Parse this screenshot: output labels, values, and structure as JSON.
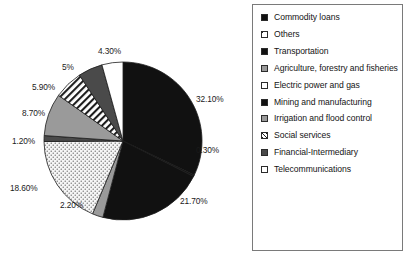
{
  "chart_data": {
    "type": "pie",
    "title": "",
    "legend_position": "right",
    "categories": [
      "Commodity loans",
      "Others",
      "Transportation",
      "Agriculture, forestry and fisheries",
      "Electric power and gas",
      "Mining and manufacturing",
      "Irrigation and flood control",
      "Social services",
      "Financial-Intermediary",
      "Telecommunications"
    ],
    "values": [
      32.1,
      0.3,
      21.7,
      2.2,
      18.6,
      1.2,
      8.7,
      5.9,
      5.0,
      4.3
    ],
    "value_labels": [
      "32.10%",
      "0.30%",
      "21.70%",
      "2.20%",
      "18.60%",
      "1.20%",
      "8.70%",
      "5.90%",
      "5%",
      "4.30%"
    ],
    "units": "percent",
    "slice_fills": [
      "black",
      "black",
      "black",
      "gray",
      "dots",
      "darkgray",
      "gray",
      "hatch",
      "darkgray",
      "white"
    ]
  },
  "pie": {
    "labels": [
      {
        "text": "32.10%",
        "left": 196,
        "top": 94
      },
      {
        "text": "0.30%",
        "left": 196,
        "top": 145
      },
      {
        "text": "21.70%",
        "left": 180,
        "top": 196
      },
      {
        "text": "2.20%",
        "left": 60,
        "top": 200
      },
      {
        "text": "18.60%",
        "left": 10,
        "top": 183
      },
      {
        "text": "1.20%",
        "left": 12,
        "top": 136
      },
      {
        "text": "8.70%",
        "left": 22,
        "top": 108
      },
      {
        "text": "5.90%",
        "left": 32,
        "top": 82
      },
      {
        "text": "5%",
        "left": 62,
        "top": 62
      },
      {
        "text": "4.30%",
        "left": 98,
        "top": 46
      }
    ]
  },
  "legend": {
    "items": [
      {
        "label": "Commodity loans",
        "fill": "sw-black"
      },
      {
        "label": "Others",
        "fill": "sw-crosshatch"
      },
      {
        "label": "Transportation",
        "fill": "sw-black"
      },
      {
        "label": "Agriculture, forestry and fisheries",
        "fill": "sw-gray"
      },
      {
        "label": "Electric power and gas",
        "fill": "sw-white"
      },
      {
        "label": "Mining and manufacturing",
        "fill": "sw-black"
      },
      {
        "label": "Irrigation and flood control",
        "fill": "sw-gray"
      },
      {
        "label": "Social services",
        "fill": "sw-hatch"
      },
      {
        "label": "Financial-Intermediary",
        "fill": "sw-darkgray"
      },
      {
        "label": "Telecommunications",
        "fill": "sw-white"
      }
    ]
  },
  "colors": {
    "black": "#111111",
    "darkgray": "#4a4a4a",
    "gray": "#9a9a9a",
    "white": "#ffffff",
    "border": "#7a7a7a",
    "text": "#141414"
  }
}
